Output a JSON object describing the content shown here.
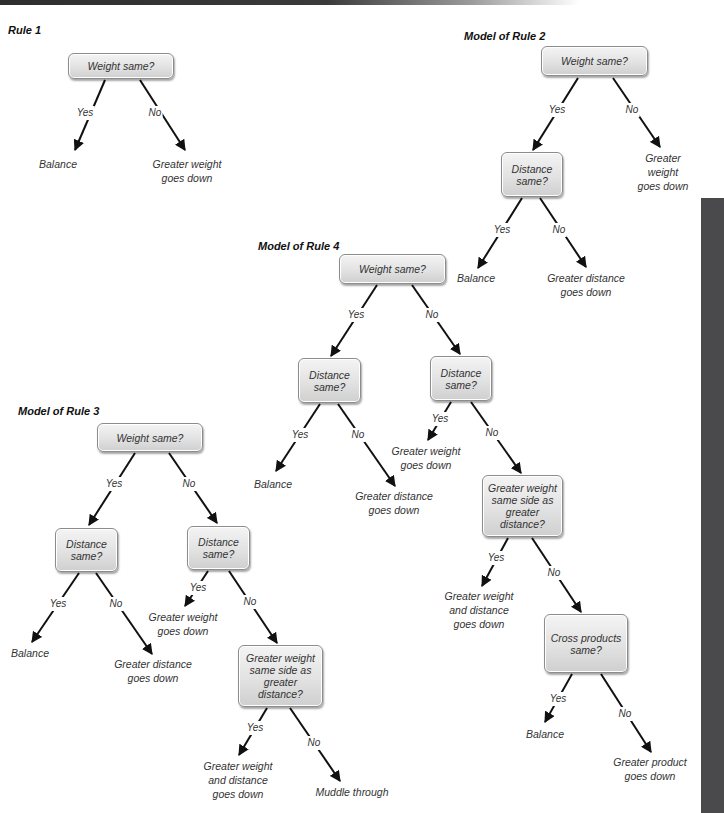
{
  "diagrams": {
    "rule1": {
      "title": "Rule 1",
      "root": "Weight same?",
      "yes": "Yes",
      "no": "No",
      "yes_leaf": "Balance",
      "no_leaf": "Greater weight\ngoes down"
    },
    "rule2": {
      "title": "Model of Rule 2",
      "root": "Weight same?",
      "root_yes": "Yes",
      "root_no": "No",
      "root_no_leaf": "Greater weight\ngoes down",
      "distance": "Distance\nsame?",
      "distance_yes": "Yes",
      "distance_no": "No",
      "distance_yes_leaf": "Balance",
      "distance_no_leaf": "Greater distance\ngoes down"
    },
    "rule3": {
      "title": "Model of Rule 3",
      "root": "Weight same?",
      "root_yes": "Yes",
      "root_no": "No",
      "distance_left": "Distance\nsame?",
      "distance_left_yes": "Yes",
      "distance_left_no": "No",
      "distance_left_yes_leaf": "Balance",
      "distance_left_no_leaf": "Greater distance\ngoes down",
      "distance_right": "Distance\nsame?",
      "distance_right_yes": "Yes",
      "distance_right_no": "No",
      "distance_right_yes_leaf": "Greater weight\ngoes down",
      "same_side": "Greater weight\nsame side as\ngreater distance?",
      "same_side_yes": "Yes",
      "same_side_no": "No",
      "same_side_yes_leaf": "Greater weight\nand distance\ngoes down",
      "same_side_no_leaf": "Muddle through"
    },
    "rule4": {
      "title": "Model of Rule 4",
      "root": "Weight same?",
      "root_yes": "Yes",
      "root_no": "No",
      "distance_left": "Distance\nsame?",
      "distance_left_yes": "Yes",
      "distance_left_no": "No",
      "distance_left_yes_leaf": "Balance",
      "distance_left_no_leaf": "Greater distance\ngoes down",
      "distance_right": "Distance\nsame?",
      "distance_right_yes": "Yes",
      "distance_right_no": "No",
      "distance_right_yes_leaf": "Greater weight\ngoes down",
      "same_side": "Greater weight\nsame side as\ngreater distance?",
      "same_side_yes": "Yes",
      "same_side_no": "No",
      "same_side_yes_leaf": "Greater weight\nand distance\ngoes down",
      "cross": "Cross products\nsame?",
      "cross_yes": "Yes",
      "cross_no": "No",
      "cross_yes_leaf": "Balance",
      "cross_no_leaf": "Greater product\ngoes down"
    }
  },
  "colors": {
    "node_border": "#8c8c8c",
    "node_fill_top": "#f4f4f4",
    "node_fill_bottom": "#cfcfcf",
    "arrow": "#111111",
    "text": "#333333",
    "sidebar": "#4a4a4c"
  }
}
